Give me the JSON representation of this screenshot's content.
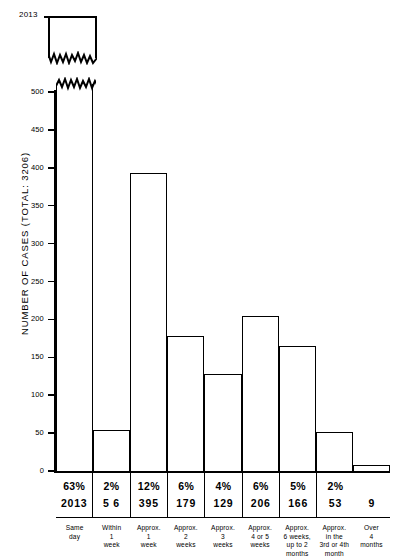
{
  "chart_data": {
    "type": "bar",
    "title": "",
    "xlabel": "",
    "ylabel": "NUMBER OF CASES   (TOTAL: 3206)",
    "ylim": [
      0,
      500
    ],
    "ytick_labels": [
      "0",
      "50",
      "100",
      "150",
      "200",
      "250",
      "300",
      "350",
      "400",
      "450",
      "500"
    ],
    "grid": false,
    "legend": null,
    "axis_break": {
      "present": true,
      "note": "first bar truncated at 500; full height 2013 shown in inset above",
      "inset_label": "2013"
    },
    "categories": [
      "Same day",
      "Within 1 week",
      "Approx. 1 week",
      "Approx. 2 weeks",
      "Approx. 3 weeks",
      "Approx. 4 or 5 weeks",
      "Approx. 6 weeks, up to 2 months",
      "Approx. in the 3rd or 4th month",
      "Over 4 months"
    ],
    "values": [
      2013,
      56,
      395,
      179,
      129,
      206,
      166,
      53,
      9
    ],
    "percent_labels": [
      "63%",
      "2%",
      "12%",
      "6%",
      "4%",
      "6%",
      "5%",
      "2%",
      ""
    ],
    "count_labels": [
      "2013",
      "5 6",
      "395",
      "179",
      "129",
      "206",
      "166",
      "53",
      "9"
    ]
  },
  "cats": [
    {
      "l1": "Same",
      "l2": "day",
      "l3": "",
      "l4": ""
    },
    {
      "l1": "Within",
      "l2": "1",
      "l3": "week",
      "l4": ""
    },
    {
      "l1": "Approx.",
      "l2": "1",
      "l3": "week",
      "l4": ""
    },
    {
      "l1": "Approx.",
      "l2": "2",
      "l3": "weeks",
      "l4": ""
    },
    {
      "l1": "Approx.",
      "l2": "3",
      "l3": "weeks",
      "l4": ""
    },
    {
      "l1": "Approx.",
      "l2": "4 or 5",
      "l3": "weeks",
      "l4": ""
    },
    {
      "l1": "Approx.",
      "l2": "6 weeks,",
      "l3": "up to 2",
      "l4": "months"
    },
    {
      "l1": "Approx.",
      "l2": "in the",
      "l3": "3rd or 4th",
      "l4": "month"
    },
    {
      "l1": "Over",
      "l2": "4",
      "l3": "months",
      "l4": ""
    }
  ],
  "colors": {
    "ink": "#000000",
    "paper": "#ffffff"
  }
}
